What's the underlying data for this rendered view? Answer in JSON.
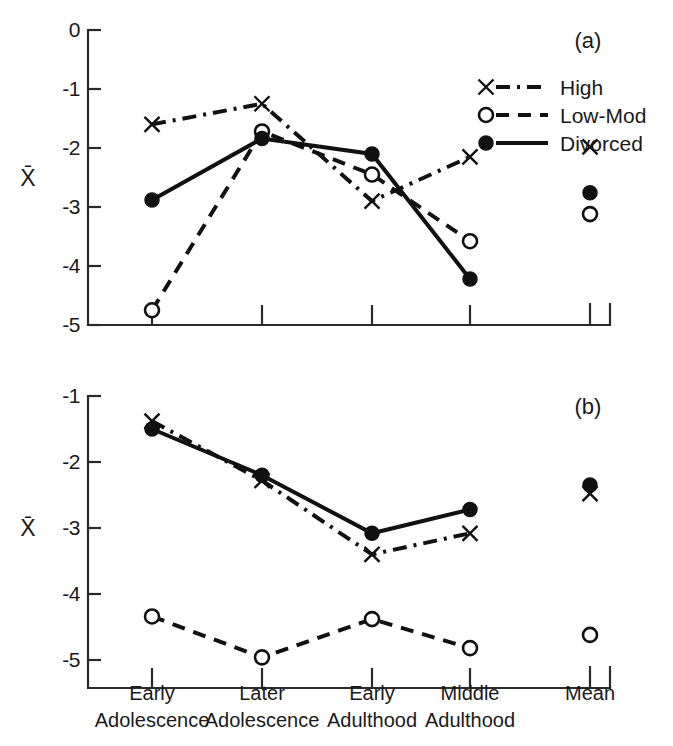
{
  "figure": {
    "width": 673,
    "height": 746,
    "background": "#ffffff",
    "ink_color": "#111111"
  },
  "axis_title": "X̄",
  "panels": [
    {
      "id": "a",
      "label": "(a)"
    },
    {
      "id": "b",
      "label": "(b)"
    }
  ],
  "legend": {
    "position": "top-right of panel (a)",
    "entries": [
      {
        "label": "High",
        "marker": "x-marker-icon",
        "line": "dash-dot"
      },
      {
        "label": "Low-Mod",
        "marker": "open-circle-marker-icon",
        "line": "dashed"
      },
      {
        "label": "Divorced",
        "marker": "filled-circle-marker-icon",
        "line": "solid"
      }
    ]
  },
  "x_categories": [
    "Early\nAdolescence",
    "Later\nAdolescence",
    "Early\nAdulthood",
    "Middle\nAdulthood",
    "Mean"
  ],
  "x_category_lines": [
    [
      "Early",
      "Adolescence"
    ],
    [
      "Later",
      "Adolescence"
    ],
    [
      "Early",
      "Adulthood"
    ],
    [
      "Middle",
      "Adulthood"
    ],
    [
      "Mean",
      ""
    ]
  ],
  "chart_data": [
    {
      "type": "line",
      "panel": "a",
      "title": "(a)",
      "xlabel": "",
      "ylabel": "X̄",
      "ylim": [
        -5,
        0
      ],
      "yticks": [
        0,
        -1,
        -2,
        -3,
        -4,
        -5
      ],
      "ytick_labels": [
        "0",
        "-1",
        "-2",
        "-3",
        "-4",
        "-5"
      ],
      "grid": false,
      "legend_position": "upper right",
      "categories": [
        "Early Adolescence",
        "Later Adolescence",
        "Early Adulthood",
        "Middle Adulthood"
      ],
      "mean_category": "Mean",
      "series": [
        {
          "name": "High",
          "marker": "x",
          "line": "dash-dot",
          "values": [
            -1.6,
            -1.25,
            -2.9,
            -2.15
          ],
          "mean": -1.98
        },
        {
          "name": "Low-Mod",
          "marker": "open-circle",
          "line": "dashed",
          "values": [
            -4.75,
            -1.72,
            -2.45,
            -3.58
          ],
          "mean": -3.12
        },
        {
          "name": "Divorced",
          "marker": "filled-circle",
          "line": "solid",
          "values": [
            -2.88,
            -1.84,
            -2.1,
            -4.22
          ],
          "mean": -2.76
        }
      ]
    },
    {
      "type": "line",
      "panel": "b",
      "title": "(b)",
      "xlabel": "",
      "ylabel": "X̄",
      "ylim": [
        -5.3,
        -1
      ],
      "yticks": [
        -1,
        -2,
        -3,
        -4,
        -5
      ],
      "ytick_labels": [
        "-1",
        "-2",
        "-3",
        "-4",
        "-5"
      ],
      "grid": false,
      "legend_position": "none",
      "categories": [
        "Early Adolescence",
        "Later Adolescence",
        "Early Adulthood",
        "Middle Adulthood"
      ],
      "mean_category": "Mean",
      "series": [
        {
          "name": "High",
          "marker": "x",
          "line": "dash-dot",
          "values": [
            -1.38,
            -2.28,
            -3.4,
            -3.08
          ],
          "mean": -2.48
        },
        {
          "name": "Low-Mod",
          "marker": "open-circle",
          "line": "dashed",
          "values": [
            -4.34,
            -4.96,
            -4.38,
            -4.82
          ],
          "mean": -4.62
        },
        {
          "name": "Divorced",
          "marker": "filled-circle",
          "line": "solid",
          "values": [
            -1.5,
            -2.2,
            -3.08,
            -2.72
          ],
          "mean": -2.35
        }
      ]
    }
  ]
}
